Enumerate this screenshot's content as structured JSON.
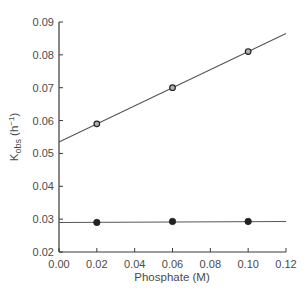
{
  "chart_data": {
    "type": "scatter",
    "title": "",
    "xlabel": "Phosphate (M)",
    "ylabel": "K",
    "ylabel_subscript": "obs",
    "ylabel_unit_prefix": " (h",
    "ylabel_unit_sup": "−1",
    "ylabel_unit_suffix": ")",
    "xlim": [
      0.0,
      0.12
    ],
    "ylim": [
      0.02,
      0.09
    ],
    "x_ticks": [
      "0.00",
      "0.02",
      "0.04",
      "0.06",
      "0.08",
      "0.10",
      "0.12"
    ],
    "y_ticks": [
      "0.02",
      "0.03",
      "0.04",
      "0.05",
      "0.06",
      "0.07",
      "0.08",
      "0.09"
    ],
    "grid": false,
    "legend": null,
    "series": [
      {
        "name": "open circles",
        "marker": "open-circle",
        "x": [
          0.02,
          0.06,
          0.1
        ],
        "y": [
          0.059,
          0.07,
          0.081
        ],
        "fit_line": {
          "x": [
            0.0,
            0.12
          ],
          "y": [
            0.0535,
            0.0865
          ]
        }
      },
      {
        "name": "filled circles",
        "marker": "filled-circle",
        "x": [
          0.02,
          0.06,
          0.1
        ],
        "y": [
          0.029,
          0.0293,
          0.0293
        ],
        "fit_line": {
          "x": [
            0.0,
            0.12
          ],
          "y": [
            0.029,
            0.0293
          ]
        }
      }
    ]
  },
  "colors": {
    "axis": "#3a3a3a",
    "line": "#555555",
    "marker": "#222222",
    "text": "#4a4a4a"
  }
}
